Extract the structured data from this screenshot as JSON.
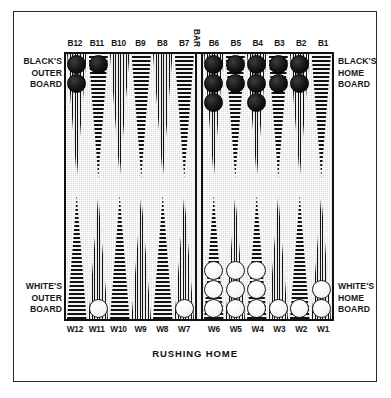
{
  "figure": {
    "caption": "RUSHING HOME",
    "bar_label": "BAR"
  },
  "captions": {
    "black_outer": "BLACK'S\nOUTER\nBOARD",
    "black_home": "BLACK'S\nHOME\nBOARD",
    "white_outer": "WHITE'S\nOUTER\nBOARD",
    "white_home": "WHITE'S\nHOME\nBOARD"
  },
  "colors": {
    "board_fill": "#d8d8d8",
    "frame": "#111111",
    "black_checker": "#141414",
    "white_checker": "#f6f6f6",
    "page_background": "#ffffff"
  },
  "top_labels": [
    "B12",
    "B11",
    "B10",
    "B9",
    "B8",
    "B7",
    "B6",
    "B5",
    "B4",
    "B3",
    "B2",
    "B1"
  ],
  "bottom_labels": [
    "W12",
    "W11",
    "W10",
    "W9",
    "W8",
    "W7",
    "W6",
    "W5",
    "W4",
    "W3",
    "W2",
    "W1"
  ],
  "board": {
    "top_points": [
      {
        "id": "B12",
        "pattern": "vertical",
        "checkers": 2,
        "color": "black"
      },
      {
        "id": "B11",
        "pattern": "horizontal",
        "checkers": 1,
        "color": "black"
      },
      {
        "id": "B10",
        "pattern": "vertical",
        "checkers": 0,
        "color": "none"
      },
      {
        "id": "B9",
        "pattern": "horizontal",
        "checkers": 0,
        "color": "none"
      },
      {
        "id": "B8",
        "pattern": "vertical",
        "checkers": 0,
        "color": "none"
      },
      {
        "id": "B7",
        "pattern": "horizontal",
        "checkers": 0,
        "color": "none"
      },
      {
        "id": "B6",
        "pattern": "vertical",
        "checkers": 3,
        "color": "black"
      },
      {
        "id": "B5",
        "pattern": "horizontal",
        "checkers": 2,
        "color": "black"
      },
      {
        "id": "B4",
        "pattern": "vertical",
        "checkers": 3,
        "color": "black"
      },
      {
        "id": "B3",
        "pattern": "horizontal",
        "checkers": 2,
        "color": "black"
      },
      {
        "id": "B2",
        "pattern": "vertical",
        "checkers": 2,
        "color": "black"
      },
      {
        "id": "B1",
        "pattern": "horizontal",
        "checkers": 0,
        "color": "none"
      }
    ],
    "bottom_points": [
      {
        "id": "W12",
        "pattern": "horizontal",
        "checkers": 0,
        "color": "none"
      },
      {
        "id": "W11",
        "pattern": "vertical",
        "checkers": 1,
        "color": "white"
      },
      {
        "id": "W10",
        "pattern": "horizontal",
        "checkers": 0,
        "color": "none"
      },
      {
        "id": "W9",
        "pattern": "vertical",
        "checkers": 0,
        "color": "none"
      },
      {
        "id": "W8",
        "pattern": "horizontal",
        "checkers": 0,
        "color": "none"
      },
      {
        "id": "W7",
        "pattern": "vertical",
        "checkers": 1,
        "color": "white"
      },
      {
        "id": "W6",
        "pattern": "horizontal",
        "checkers": 3,
        "color": "white"
      },
      {
        "id": "W5",
        "pattern": "vertical",
        "checkers": 3,
        "color": "white"
      },
      {
        "id": "W4",
        "pattern": "horizontal",
        "checkers": 3,
        "color": "white"
      },
      {
        "id": "W3",
        "pattern": "vertical",
        "checkers": 1,
        "color": "white"
      },
      {
        "id": "W2",
        "pattern": "horizontal",
        "checkers": 1,
        "color": "white"
      },
      {
        "id": "W1",
        "pattern": "vertical",
        "checkers": 2,
        "color": "white"
      }
    ]
  }
}
